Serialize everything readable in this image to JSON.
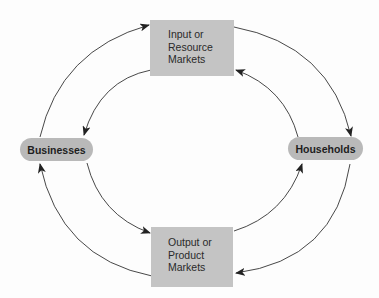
{
  "diagram": {
    "type": "circular-flow",
    "colors": {
      "box_fill": "#c4c4c4",
      "pill_fill": "#b9b9b9",
      "arrow": "#333333",
      "background": "#fdfdfd"
    },
    "nodes": {
      "input_market": {
        "lines": [
          "Input or",
          "Resource",
          "Markets"
        ]
      },
      "output_market": {
        "lines": [
          "Output or",
          "Product",
          "Markets"
        ]
      },
      "businesses": {
        "label": "Businesses"
      },
      "households": {
        "label": "Households"
      }
    },
    "edges": [
      {
        "from": "input_market",
        "to": "households",
        "path": "outer-top-right"
      },
      {
        "from": "households",
        "to": "input_market",
        "path": "inner-top-right"
      },
      {
        "from": "businesses",
        "to": "input_market",
        "path": "outer-top-left"
      },
      {
        "from": "input_market",
        "to": "businesses",
        "path": "inner-top-left"
      },
      {
        "from": "businesses",
        "to": "output_market",
        "path": "inner-bottom-left"
      },
      {
        "from": "output_market",
        "to": "businesses",
        "path": "outer-bottom-left"
      },
      {
        "from": "output_market",
        "to": "households",
        "path": "inner-bottom-right"
      },
      {
        "from": "households",
        "to": "output_market",
        "path": "outer-bottom-right"
      }
    ]
  }
}
